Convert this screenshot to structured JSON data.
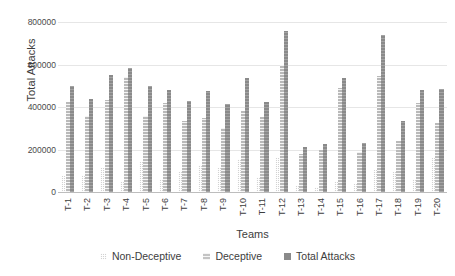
{
  "chart_data": {
    "type": "bar",
    "title": "",
    "xlabel": "Teams",
    "ylabel": "Total Attacks",
    "ylim": [
      0,
      800000
    ],
    "yticks": [
      800000,
      600000,
      400000,
      200000,
      0
    ],
    "grid": true,
    "legend_position": "bottom",
    "categories": [
      "T-1",
      "T-2",
      "T-3",
      "T-4",
      "T-5",
      "T-6",
      "T-7",
      "T-8",
      "T-9",
      "T-10",
      "T-11",
      "T-12",
      "T-13",
      "T-14",
      "T-15",
      "T-16",
      "T-17",
      "T-18",
      "T-19",
      "T-20"
    ],
    "series": [
      {
        "name": "Non-Deceptive",
        "values": [
          75000,
          80000,
          115000,
          45000,
          140000,
          60000,
          95000,
          125000,
          115000,
          155000,
          70000,
          160000,
          30000,
          25000,
          45000,
          40000,
          105000,
          95000,
          60000,
          160000
        ]
      },
      {
        "name": "Deceptive",
        "values": [
          425000,
          360000,
          435000,
          540000,
          360000,
          420000,
          335000,
          350000,
          300000,
          380000,
          355000,
          600000,
          180000,
          200000,
          490000,
          190000,
          545000,
          240000,
          420000,
          325000
        ]
      },
      {
        "name": "Total Attacks",
        "values": [
          500000,
          440000,
          550000,
          585000,
          500000,
          480000,
          430000,
          475000,
          415000,
          535000,
          425000,
          760000,
          210000,
          225000,
          535000,
          230000,
          740000,
          335000,
          480000,
          485000
        ]
      }
    ]
  },
  "legend": {
    "items": [
      {
        "label": "Non-Deceptive"
      },
      {
        "label": "Deceptive"
      },
      {
        "label": "Total Attacks"
      }
    ]
  }
}
